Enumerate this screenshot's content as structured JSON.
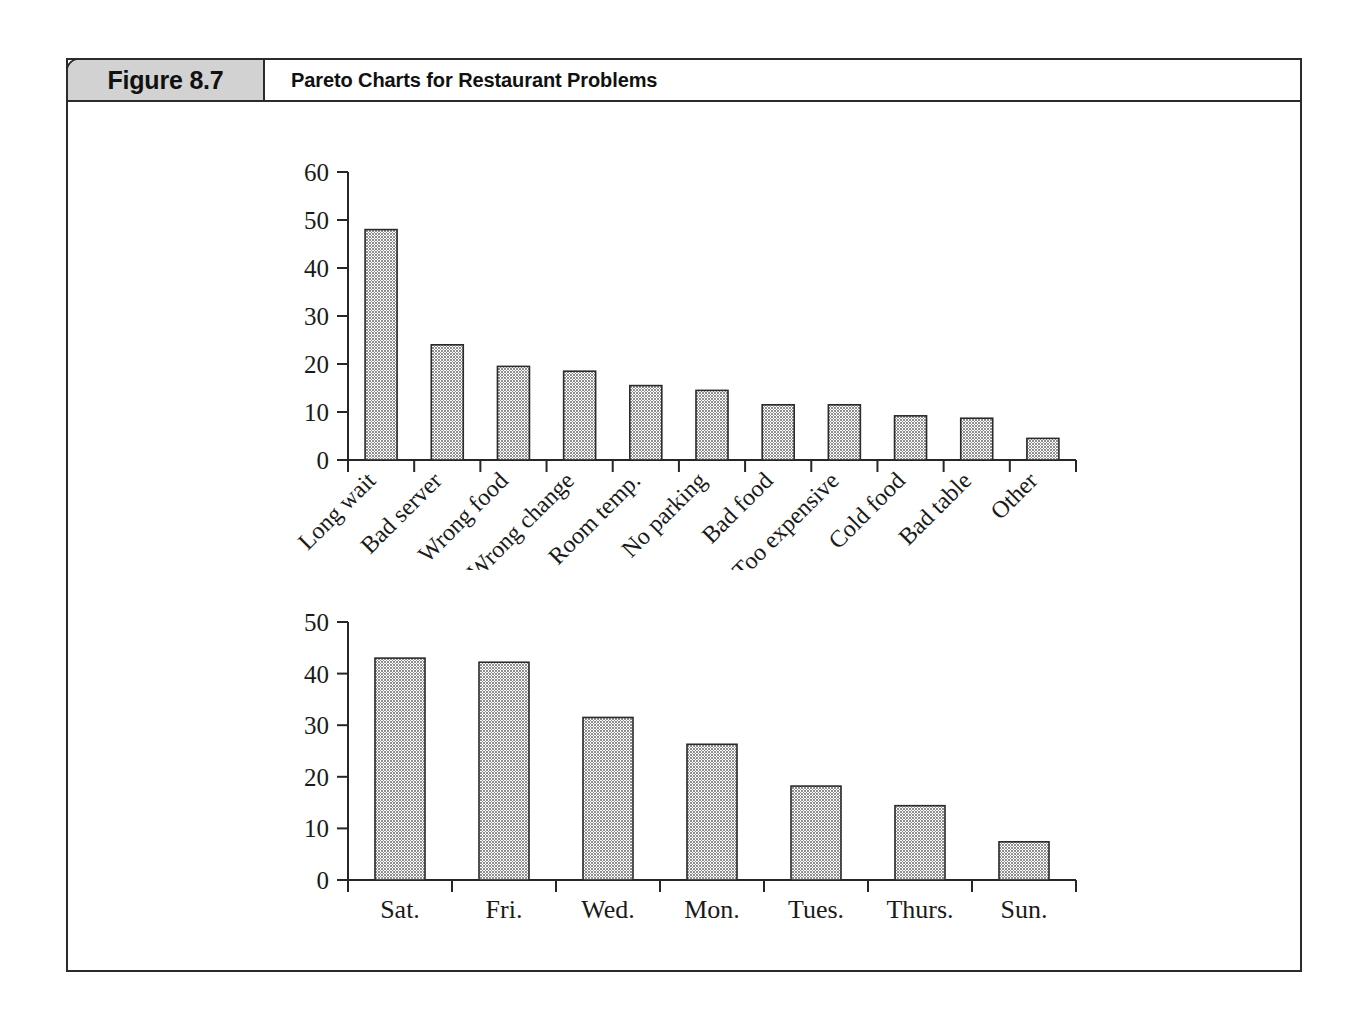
{
  "figure": {
    "number_label": "Figure 8.7",
    "title": "Pareto Charts for Restaurant Problems"
  },
  "colors": {
    "bar_fill": "#8f8f8f",
    "bar_stroke": "#2a2a2a",
    "axis": "#262626",
    "header_band": "#d2d2d2",
    "frame": "#2b2b2b",
    "text": "#1a1a1a"
  },
  "chart_data": [
    {
      "type": "bar",
      "id": "pareto-problems",
      "title": "",
      "xlabel": "",
      "ylabel": "",
      "ylim": [
        0,
        60
      ],
      "yticks": [
        0,
        10,
        20,
        30,
        40,
        50,
        60
      ],
      "ytick_labels": [
        "0",
        "10",
        "20",
        "30",
        "40",
        "50",
        "60"
      ],
      "grid": false,
      "legend": "none",
      "xtick_rotation": 45,
      "categories": [
        "Long wait",
        "Bad server",
        "Wrong food",
        "Wrong change",
        "Room temp.",
        "No parking",
        "Bad food",
        "Too expensive",
        "Cold food",
        "Bad table",
        "Other"
      ],
      "values": [
        48,
        24,
        19.5,
        18.5,
        15.5,
        14.5,
        11.5,
        11.5,
        9.2,
        8.7,
        4.5
      ]
    },
    {
      "type": "bar",
      "id": "pareto-days",
      "title": "",
      "xlabel": "",
      "ylabel": "",
      "ylim": [
        0,
        50
      ],
      "yticks": [
        0,
        10,
        20,
        30,
        40,
        50
      ],
      "ytick_labels": [
        "0",
        "10",
        "20",
        "30",
        "40",
        "50"
      ],
      "grid": false,
      "legend": "none",
      "xtick_rotation": 0,
      "categories": [
        "Sat.",
        "Fri.",
        "Wed.",
        "Mon.",
        "Tues.",
        "Thurs.",
        "Sun."
      ],
      "values": [
        43,
        42.2,
        31.5,
        26.3,
        18.2,
        14.4,
        7.4
      ]
    }
  ]
}
